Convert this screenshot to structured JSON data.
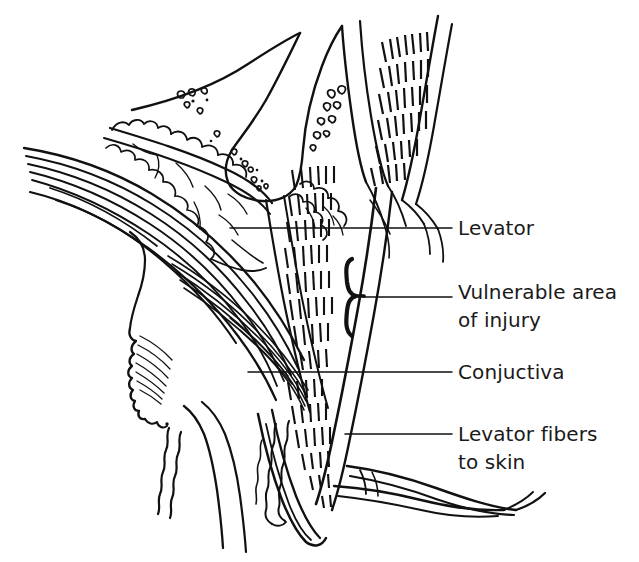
{
  "figure": {
    "type": "anatomical-line-drawing",
    "background_color": "#ffffff",
    "ink_color": "#111111",
    "text_color": "#1a1a1a",
    "width": 639,
    "height": 562
  },
  "labels": [
    {
      "id": "levator",
      "text": "Levator",
      "lines": [
        "Levator"
      ],
      "text_x": 458,
      "text_y": 228,
      "leader": {
        "x1": 230,
        "y1": 228,
        "x2": 452,
        "y2": 228
      },
      "marker": "none"
    },
    {
      "id": "vulnerable",
      "text": "Vulnerable area of injury",
      "lines": [
        "Vulnerable area",
        "of injury"
      ],
      "text_x": 458,
      "text_y": 292,
      "leader": {
        "x1": 363,
        "y1": 297,
        "x2": 452,
        "y2": 297
      },
      "marker": "brace",
      "brace": {
        "x": 350,
        "y_top": 258,
        "y_bottom": 337,
        "tip_x": 363,
        "tip_y": 297
      }
    },
    {
      "id": "conjuctiva",
      "text": "Conjuctiva",
      "lines": [
        "Conjuctiva"
      ],
      "text_x": 458,
      "text_y": 372,
      "leader": {
        "x1": 248,
        "y1": 372,
        "x2": 452,
        "y2": 372
      },
      "marker": "none"
    },
    {
      "id": "levator-fibers",
      "text": "Levator fibers to skin",
      "lines": [
        "Levator fibers",
        "to skin"
      ],
      "text_x": 458,
      "text_y": 434,
      "leader": {
        "x1": 345,
        "y1": 434,
        "x2": 452,
        "y2": 434
      },
      "marker": "none"
    }
  ],
  "structures": [
    {
      "name": "superior-orbital-rim",
      "kind": "outline"
    },
    {
      "name": "orbital-fat-lobules",
      "kind": "lobulated"
    },
    {
      "name": "levator-muscle-hatching",
      "kind": "hatched"
    },
    {
      "name": "mullers-muscle",
      "kind": "outline"
    },
    {
      "name": "conjunctiva-surface",
      "kind": "outline"
    },
    {
      "name": "tarsal-plate",
      "kind": "outline"
    },
    {
      "name": "meibomian-glands",
      "kind": "wavy"
    },
    {
      "name": "orbicularis-skin-layers",
      "kind": "parallel-strokes"
    },
    {
      "name": "eyebrow-skin-fold",
      "kind": "wavy"
    },
    {
      "name": "levator-aponeurosis-strands",
      "kind": "strands"
    },
    {
      "name": "eyelash-tendon-strands",
      "kind": "strands"
    }
  ]
}
